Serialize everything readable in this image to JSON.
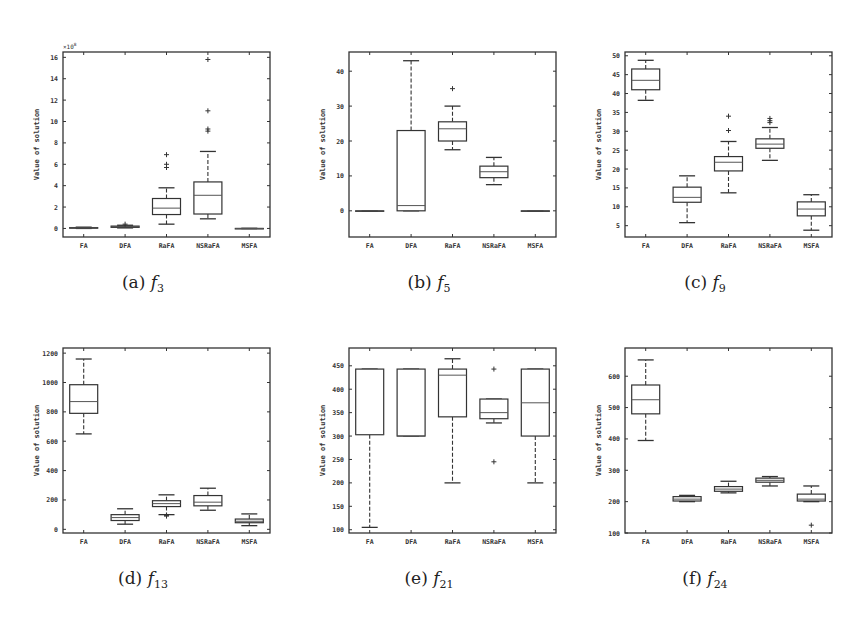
{
  "figure": {
    "panels": [
      {
        "id": "a",
        "caption_label": "(a)",
        "caption_fn": "f",
        "caption_sub": "3"
      },
      {
        "id": "b",
        "caption_label": "(b)",
        "caption_fn": "f",
        "caption_sub": "5"
      },
      {
        "id": "c",
        "caption_label": "(c)",
        "caption_fn": "f",
        "caption_sub": "9"
      },
      {
        "id": "d",
        "caption_label": "(d)",
        "caption_fn": "f",
        "caption_sub": "13"
      },
      {
        "id": "e",
        "caption_label": "(e)",
        "caption_fn": "f",
        "caption_sub": "21"
      },
      {
        "id": "f",
        "caption_label": "(f)",
        "caption_fn": "f",
        "caption_sub": "24"
      }
    ]
  },
  "chart_data": [
    {
      "type": "boxplot",
      "title": "(a) f3",
      "xlabel": "",
      "ylabel": "Value of solution",
      "y_multiplier_label": "x10^8",
      "categories": [
        "FA",
        "DFA",
        "RaFA",
        "NSRaFA",
        "MSFA"
      ],
      "ylim": [
        -0.8,
        16.5
      ],
      "yticks": [
        0,
        2,
        4,
        6,
        8,
        10,
        12,
        14,
        16
      ],
      "boxes": [
        {
          "min": 0,
          "q1": 0.02,
          "median": 0.05,
          "q3": 0.08,
          "max": 0.12,
          "outliers": []
        },
        {
          "min": 0.05,
          "q1": 0.1,
          "median": 0.15,
          "q3": 0.22,
          "max": 0.3,
          "outliers": [
            0.4
          ]
        },
        {
          "min": 0.4,
          "q1": 1.3,
          "median": 1.9,
          "q3": 2.8,
          "max": 3.8,
          "outliers": [
            5.7,
            6.0,
            6.9
          ]
        },
        {
          "min": 0.9,
          "q1": 1.35,
          "median": 3.1,
          "q3": 4.35,
          "max": 7.2,
          "outliers": [
            9.1,
            9.3,
            11.0,
            15.8
          ]
        },
        {
          "min": 0,
          "q1": 0,
          "median": 0,
          "q3": 0,
          "max": 0,
          "outliers": []
        }
      ]
    },
    {
      "type": "boxplot",
      "title": "(b) f5",
      "xlabel": "",
      "ylabel": "Value of solution",
      "categories": [
        "FA",
        "DFA",
        "RaFA",
        "NSRaFA",
        "MSFA"
      ],
      "ylim": [
        -7.5,
        45.5
      ],
      "yticks": [
        0,
        10,
        20,
        30,
        40
      ],
      "boxes": [
        {
          "min": 0,
          "q1": 0,
          "median": 0,
          "q3": 0,
          "max": 0,
          "outliers": []
        },
        {
          "min": 0,
          "q1": 0,
          "median": 1.5,
          "q3": 23,
          "max": 43,
          "outliers": []
        },
        {
          "min": 17.5,
          "q1": 20,
          "median": 23.5,
          "q3": 25.5,
          "max": 30,
          "outliers": [
            35
          ]
        },
        {
          "min": 7.5,
          "q1": 9.5,
          "median": 11.2,
          "q3": 12.8,
          "max": 15.3,
          "outliers": []
        },
        {
          "min": 0,
          "q1": 0,
          "median": 0,
          "q3": 0,
          "max": 0,
          "outliers": []
        }
      ]
    },
    {
      "type": "boxplot",
      "title": "(c) f9",
      "xlabel": "",
      "ylabel": "Value of solution",
      "categories": [
        "FA",
        "DFA",
        "RaFA",
        "NSRaFA",
        "MSFA"
      ],
      "ylim": [
        2,
        51
      ],
      "yticks": [
        5,
        10,
        15,
        20,
        25,
        30,
        35,
        40,
        45,
        50
      ],
      "boxes": [
        {
          "min": 38.2,
          "q1": 41,
          "median": 43.5,
          "q3": 46.5,
          "max": 48.8,
          "outliers": []
        },
        {
          "min": 5.8,
          "q1": 11.2,
          "median": 12.5,
          "q3": 15.2,
          "max": 18.2,
          "outliers": []
        },
        {
          "min": 13.7,
          "q1": 19.5,
          "median": 21.8,
          "q3": 23.3,
          "max": 27.3,
          "outliers": [
            30.2,
            34
          ]
        },
        {
          "min": 22.3,
          "q1": 25.5,
          "median": 26.6,
          "q3": 28,
          "max": 31,
          "outliers": [
            32.3,
            32.8,
            33.4
          ]
        },
        {
          "min": 3.8,
          "q1": 7.6,
          "median": 9.4,
          "q3": 11.3,
          "max": 13.2,
          "outliers": []
        }
      ]
    },
    {
      "type": "boxplot",
      "title": "(d) f13",
      "xlabel": "",
      "ylabel": "Value of solution",
      "categories": [
        "FA",
        "DFA",
        "RaFA",
        "NSRaFA",
        "MSFA"
      ],
      "ylim": [
        -25,
        1235
      ],
      "yticks": [
        0,
        200,
        400,
        600,
        800,
        1000,
        1200
      ],
      "boxes": [
        {
          "min": 650,
          "q1": 790,
          "median": 870,
          "q3": 985,
          "max": 1160,
          "outliers": []
        },
        {
          "min": 35,
          "q1": 60,
          "median": 80,
          "q3": 100,
          "max": 140,
          "outliers": []
        },
        {
          "min": 100,
          "q1": 155,
          "median": 175,
          "q3": 195,
          "max": 235,
          "outliers": [
            90,
            95
          ]
        },
        {
          "min": 130,
          "q1": 160,
          "median": 185,
          "q3": 230,
          "max": 280,
          "outliers": []
        },
        {
          "min": 25,
          "q1": 45,
          "median": 55,
          "q3": 70,
          "max": 105,
          "outliers": []
        }
      ]
    },
    {
      "type": "boxplot",
      "title": "(e) f21",
      "xlabel": "",
      "ylabel": "Value of solution",
      "categories": [
        "FA",
        "DFA",
        "RaFA",
        "NSRaFA",
        "MSFA"
      ],
      "ylim": [
        93,
        488
      ],
      "yticks": [
        100,
        150,
        200,
        250,
        300,
        350,
        400,
        450
      ],
      "boxes": [
        {
          "min": 105,
          "q1": 303,
          "median": 303,
          "q3": 443,
          "max": 443,
          "outliers": []
        },
        {
          "min": 300,
          "q1": 300,
          "median": 300,
          "q3": 443,
          "max": 443,
          "outliers": []
        },
        {
          "min": 200,
          "q1": 341,
          "median": 430,
          "q3": 443,
          "max": 465,
          "outliers": []
        },
        {
          "min": 328,
          "q1": 337,
          "median": 350,
          "q3": 379,
          "max": 379,
          "outliers": [
            245,
            443
          ]
        },
        {
          "min": 200,
          "q1": 300,
          "median": 371,
          "q3": 443,
          "max": 443,
          "outliers": []
        }
      ]
    },
    {
      "type": "boxplot",
      "title": "(f) f24",
      "xlabel": "",
      "ylabel": "Value of solution",
      "categories": [
        "FA",
        "DFA",
        "RaFA",
        "NSRaFA",
        "MSFA"
      ],
      "ylim": [
        100,
        690
      ],
      "yticks": [
        100,
        200,
        300,
        400,
        500,
        600
      ],
      "boxes": [
        {
          "min": 395,
          "q1": 480,
          "median": 525,
          "q3": 572,
          "max": 652,
          "outliers": []
        },
        {
          "min": 200,
          "q1": 202,
          "median": 208,
          "q3": 216,
          "max": 220,
          "outliers": []
        },
        {
          "min": 228,
          "q1": 233,
          "median": 240,
          "q3": 248,
          "max": 265,
          "outliers": []
        },
        {
          "min": 250,
          "q1": 262,
          "median": 268,
          "q3": 275,
          "max": 280,
          "outliers": []
        },
        {
          "min": 200,
          "q1": 202,
          "median": 208,
          "q3": 224,
          "max": 250,
          "outliers": [
            125
          ]
        }
      ]
    }
  ]
}
